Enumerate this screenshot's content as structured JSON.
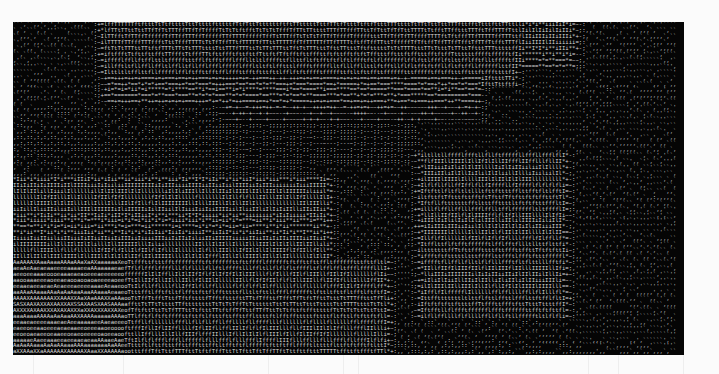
{
  "image": {
    "kind": "ascii-art-render",
    "rows": 56,
    "cols": 197,
    "ramp": " .'`,:;-~+=*iIlftTfoeaAXSW#",
    "colors": {
      "background": "#050505",
      "glyph": "#d8d8d8",
      "page": "#fbfbfb"
    }
  },
  "regions": [
    {
      "name": "top-left-dark",
      "r0": 0,
      "r1": 14,
      "c0": 0,
      "c1": 26,
      "level": 0.12
    },
    {
      "name": "top-bright-band",
      "r0": 0,
      "r1": 11,
      "c0": 26,
      "c1": 150,
      "level": 0.62
    },
    {
      "name": "top-bright-band-right-fade",
      "r0": 0,
      "r1": 8,
      "c0": 150,
      "c1": 168,
      "level": 0.45
    },
    {
      "name": "top-right-dark",
      "r0": 0,
      "r1": 56,
      "c0": 168,
      "c1": 197,
      "level": 0.12
    },
    {
      "name": "upper-mid-contour",
      "r0": 9,
      "r1": 17,
      "c0": 26,
      "c1": 140,
      "level": 0.36
    },
    {
      "name": "left-mid-dark",
      "r0": 14,
      "r1": 30,
      "c0": 0,
      "c1": 60,
      "level": 0.16
    },
    {
      "name": "center-mid-tone",
      "r0": 17,
      "r1": 30,
      "c0": 60,
      "c1": 120,
      "level": 0.24
    },
    {
      "name": "center-valley-dark",
      "r0": 24,
      "r1": 40,
      "c0": 90,
      "c1": 120,
      "level": 0.14
    },
    {
      "name": "left-hill",
      "r0": 26,
      "r1": 40,
      "c0": 0,
      "c1": 95,
      "level": 0.48
    },
    {
      "name": "right-blob",
      "r0": 22,
      "r1": 50,
      "c0": 120,
      "c1": 165,
      "level": 0.55
    },
    {
      "name": "bottom-left-bright",
      "r0": 40,
      "r1": 56,
      "c0": 0,
      "c1": 34,
      "level": 0.82
    },
    {
      "name": "bottom-mid-band",
      "r0": 40,
      "r1": 56,
      "c0": 34,
      "c1": 112,
      "level": 0.58
    },
    {
      "name": "bottom-right-dark",
      "r0": 50,
      "r1": 56,
      "c0": 112,
      "c1": 168,
      "level": 0.15
    }
  ],
  "footer": {
    "grid_line_positions": [
      20,
      110,
      255,
      330,
      345,
      575,
      605,
      670
    ]
  }
}
